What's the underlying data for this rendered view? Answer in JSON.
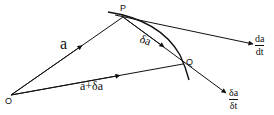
{
  "diagram": {
    "points": {
      "O": {
        "label": "O",
        "x": 11,
        "y": 95
      },
      "P": {
        "label": "P",
        "x": 123,
        "y": 17
      },
      "Q": {
        "label": "Q",
        "x": 183,
        "y": 64
      }
    },
    "vectors": {
      "a": {
        "label": "a"
      },
      "a_plus_delta_a": {
        "label": "a+δa"
      },
      "delta_a": {
        "label": "δa"
      }
    },
    "derivative": {
      "numerator": "da",
      "denominator": "dt"
    },
    "difference_quotient": {
      "numerator": "δa",
      "denominator": "δt"
    },
    "colors": {
      "ink": "#111111",
      "background": "#ffffff"
    }
  }
}
